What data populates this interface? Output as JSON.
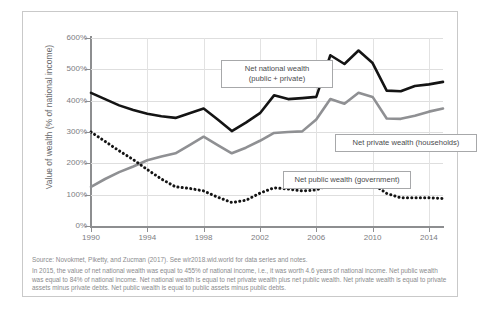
{
  "chart_data": {
    "type": "line",
    "title": "",
    "xlabel": "",
    "ylabel": "Value of wealth (% of national income)",
    "x": [
      1990,
      1991,
      1992,
      1993,
      1994,
      1995,
      1996,
      1997,
      1998,
      1999,
      2000,
      2001,
      2002,
      2003,
      2004,
      2005,
      2006,
      2007,
      2008,
      2009,
      2010,
      2011,
      2012,
      2013,
      2014,
      2015
    ],
    "xlim": [
      1990,
      2015
    ],
    "ylim": [
      0,
      600
    ],
    "yticks": [
      0,
      100,
      200,
      300,
      400,
      500,
      600
    ],
    "ytick_labels": [
      "0%",
      "100%",
      "200%",
      "300%",
      "400%",
      "500%",
      "600%"
    ],
    "xticks": [
      1990,
      1994,
      1998,
      2002,
      2006,
      2010,
      2014
    ],
    "xtick_labels": [
      "1990",
      "1994",
      "1998",
      "2002",
      "2006",
      "2010",
      "2014"
    ],
    "grid": true,
    "legend_position": "inline-callouts",
    "series": [
      {
        "name": "Net national wealth (public + private)",
        "style": "solid",
        "color": "#141414",
        "width": 2.6,
        "values": [
          425,
          405,
          385,
          370,
          358,
          350,
          345,
          360,
          375,
          340,
          303,
          330,
          360,
          417,
          405,
          408,
          412,
          545,
          517,
          560,
          520,
          432,
          430,
          447,
          452,
          460
        ]
      },
      {
        "name": "Net private wealth (households)",
        "style": "solid",
        "color": "#8f9093",
        "width": 2.6,
        "values": [
          125,
          150,
          172,
          190,
          210,
          222,
          232,
          258,
          285,
          258,
          232,
          250,
          272,
          297,
          300,
          302,
          340,
          405,
          390,
          425,
          412,
          343,
          342,
          352,
          365,
          375
        ]
      },
      {
        "name": "Net public wealth (government)",
        "style": "dotted",
        "color": "#141414",
        "width": 2.6,
        "values": [
          300,
          270,
          240,
          212,
          180,
          150,
          125,
          120,
          112,
          92,
          75,
          82,
          105,
          122,
          118,
          112,
          115,
          132,
          140,
          128,
          135,
          104,
          90,
          90,
          90,
          88
        ]
      }
    ],
    "annotations": [
      {
        "name": "callout-national",
        "text_line1": "Net national wealth",
        "text_line2": "(public + private)"
      },
      {
        "name": "callout-private",
        "text_line1": "Net private wealth (households)",
        "text_line2": ""
      },
      {
        "name": "callout-public",
        "text_line1": "Net public wealth (government)",
        "text_line2": ""
      }
    ]
  },
  "callouts": {
    "national_l1": "Net national wealth",
    "national_l2": "(public + private)",
    "private": "Net private wealth (households)",
    "public": "Net public wealth (government)"
  },
  "axis": {
    "y_title": "Value of wealth (% of national income)"
  },
  "footnote": {
    "source": "Source:  Novokmet, Piketty, and Zucman (2017). See wir2018.wid.world for data series and notes.",
    "note": "In 2015, the value of net national wealth was equal to 455% of national income, i.e., it was worth 4.6 years of national income. Net public wealth was equal to 84% of national income. Net national wealth is equal to net private wealth plus net public wealth. Net private wealth is equal to private assets minus private debts. Net public wealth is equal to public assets minus public debts."
  },
  "colors": {
    "national": "#141414",
    "private": "#8f9093",
    "public": "#141414",
    "grid": "#dedede",
    "axis": "#8d8e90",
    "frame": "#c9c9c9",
    "text": "#7c7d7f"
  }
}
